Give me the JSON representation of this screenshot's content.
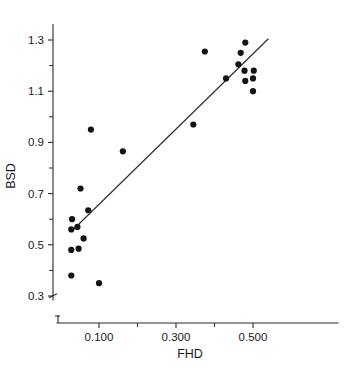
{
  "chart_data": {
    "type": "scatter",
    "title": "",
    "xlabel": "FHD",
    "ylabel": "BSD",
    "grid": false,
    "legend": "none",
    "axis_break_x": true,
    "axis_break_y": true,
    "xlim": [
      0.02,
      0.56
    ],
    "ylim": [
      0.26,
      1.36
    ],
    "x_ticks_major": [
      0.1,
      0.3,
      0.5
    ],
    "x_ticks_major_labels": [
      "0.100",
      "0.300",
      "0.500"
    ],
    "x_ticks_minor": [
      0.2,
      0.4
    ],
    "y_ticks_major": [
      0.3,
      0.5,
      0.7,
      0.9,
      1.1,
      1.3
    ],
    "y_ticks_major_labels": [
      "0.3",
      "0.5",
      "0.7",
      "0.9",
      "1.1",
      "1.3"
    ],
    "y_ticks_minor": [
      0.4,
      0.6,
      0.8,
      1.0,
      1.2
    ],
    "series": [
      {
        "name": "observations",
        "marker": "filled-circle",
        "color": "#141414",
        "points": [
          {
            "x": 0.03,
            "y": 0.6
          },
          {
            "x": 0.028,
            "y": 0.56
          },
          {
            "x": 0.044,
            "y": 0.57
          },
          {
            "x": 0.028,
            "y": 0.48
          },
          {
            "x": 0.047,
            "y": 0.485
          },
          {
            "x": 0.06,
            "y": 0.525
          },
          {
            "x": 0.028,
            "y": 0.38
          },
          {
            "x": 0.052,
            "y": 0.72
          },
          {
            "x": 0.072,
            "y": 0.635
          },
          {
            "x": 0.079,
            "y": 0.95
          },
          {
            "x": 0.1,
            "y": 0.35
          },
          {
            "x": 0.162,
            "y": 0.865
          },
          {
            "x": 0.345,
            "y": 0.97
          },
          {
            "x": 0.375,
            "y": 1.255
          },
          {
            "x": 0.43,
            "y": 1.15
          },
          {
            "x": 0.468,
            "y": 1.25
          },
          {
            "x": 0.462,
            "y": 1.205
          },
          {
            "x": 0.48,
            "y": 1.29
          },
          {
            "x": 0.478,
            "y": 1.18
          },
          {
            "x": 0.48,
            "y": 1.14
          },
          {
            "x": 0.502,
            "y": 1.18
          },
          {
            "x": 0.5,
            "y": 1.15
          },
          {
            "x": 0.5,
            "y": 1.1
          }
        ]
      }
    ],
    "fit_line": {
      "name": "regression-line",
      "x_start": 0.03,
      "y_start": 0.555,
      "x_end": 0.54,
      "y_end": 1.305
    }
  }
}
